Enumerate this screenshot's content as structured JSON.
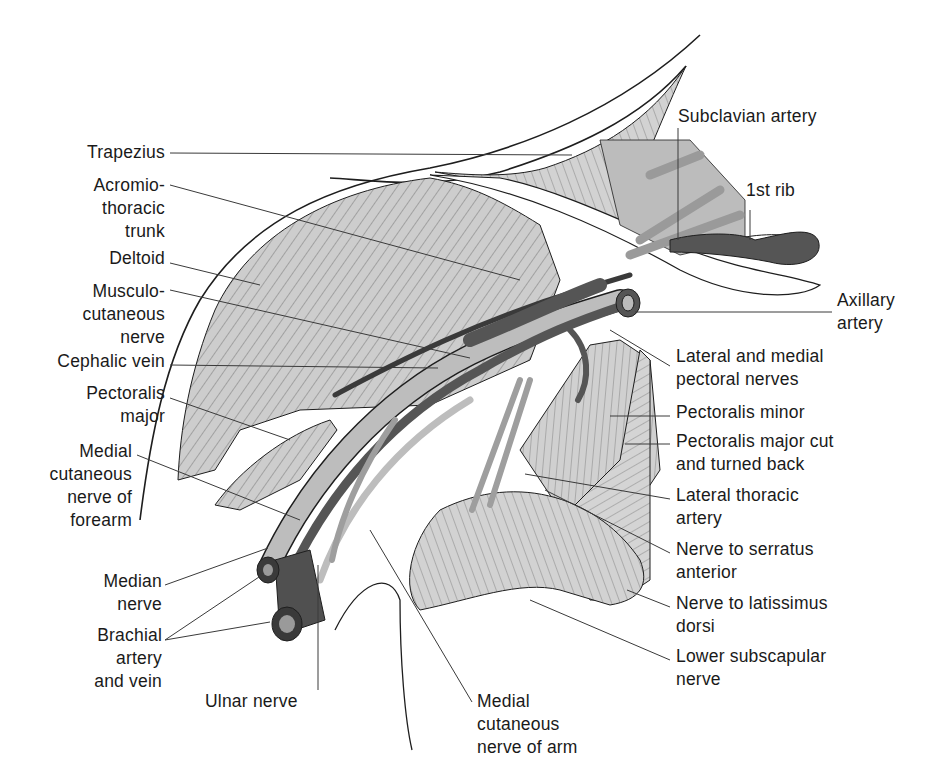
{
  "figure": {
    "type": "anatomical-illustration",
    "colors": {
      "muscle_fill": "#c8c8c8",
      "muscle_light": "#d9d9d9",
      "artery_dark": "#555555",
      "nerve_fill": "#bdbdbd",
      "outline": "#1e1e1e",
      "leader": "#3a3a3a",
      "background": "#ffffff"
    }
  },
  "labels_left": [
    {
      "id": "trapezius",
      "text": "Trapezius"
    },
    {
      "id": "acromiothoracic-trunk",
      "text": "Acromio-\nthoracic\ntrunk"
    },
    {
      "id": "deltoid",
      "text": "Deltoid"
    },
    {
      "id": "musculocutaneous-nerve",
      "text": "Musculo-\ncutaneous\nnerve"
    },
    {
      "id": "cephalic-vein",
      "text": "Cephalic vein"
    },
    {
      "id": "pectoralis-major",
      "text": "Pectoralis\nmajor"
    },
    {
      "id": "medial-cutaneous-nerve-forearm",
      "text": "Medial\ncutaneous\nnerve of\nforearm"
    },
    {
      "id": "median-nerve",
      "text": "Median\nnerve"
    },
    {
      "id": "brachial-artery-vein",
      "text": "Brachial\nartery\nand vein"
    }
  ],
  "labels_bottom": [
    {
      "id": "ulnar-nerve",
      "text": "Ulnar nerve"
    },
    {
      "id": "medial-cutaneous-nerve-arm",
      "text": "Medial\ncutaneous\nnerve of arm"
    }
  ],
  "labels_right": [
    {
      "id": "subclavian-artery",
      "text": "Subclavian artery"
    },
    {
      "id": "first-rib",
      "text": "1st rib"
    },
    {
      "id": "axillary-artery",
      "text": "Axillary\nartery"
    },
    {
      "id": "lateral-medial-pectoral-nerves",
      "text": "Lateral and medial\npectoral nerves"
    },
    {
      "id": "pectoralis-minor",
      "text": "Pectoralis minor"
    },
    {
      "id": "pectoralis-major-cut",
      "text": "Pectoralis major cut\nand turned back"
    },
    {
      "id": "lateral-thoracic-artery",
      "text": "Lateral thoracic\nartery"
    },
    {
      "id": "nerve-to-serratus-anterior",
      "text": "Nerve to serratus\nanterior"
    },
    {
      "id": "nerve-to-latissimus-dorsi",
      "text": "Nerve to latissimus\ndorsi"
    },
    {
      "id": "lower-subscapular-nerve",
      "text": "Lower subscapular\nnerve"
    }
  ]
}
